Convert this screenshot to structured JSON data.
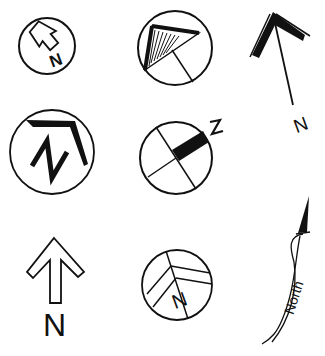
{
  "colors": {
    "ink": "#111111",
    "background": "#ffffff"
  },
  "symbols": [
    {
      "id": "house-arrow-circle",
      "icon": "north-arrow-house-icon",
      "label": "N"
    },
    {
      "id": "hatched-triangle-circle",
      "icon": "north-arrow-hatched-triangle-icon",
      "label": ""
    },
    {
      "id": "chevron-line-arrow",
      "icon": "north-arrow-chevron-line-icon",
      "label": "N"
    },
    {
      "id": "bold-corner-circle",
      "icon": "north-arrow-corner-n-icon",
      "label": "N"
    },
    {
      "id": "black-bar-crosshair-circle",
      "icon": "north-arrow-black-bar-icon",
      "label": "N"
    },
    {
      "id": "outline-arrow",
      "icon": "north-arrow-outline-icon",
      "label": "N"
    },
    {
      "id": "chevron-circle",
      "icon": "north-arrow-chevron-circle-icon",
      "label": "N"
    },
    {
      "id": "curved-north-arrow",
      "icon": "north-arrow-curved-text-icon",
      "label": "North"
    }
  ]
}
